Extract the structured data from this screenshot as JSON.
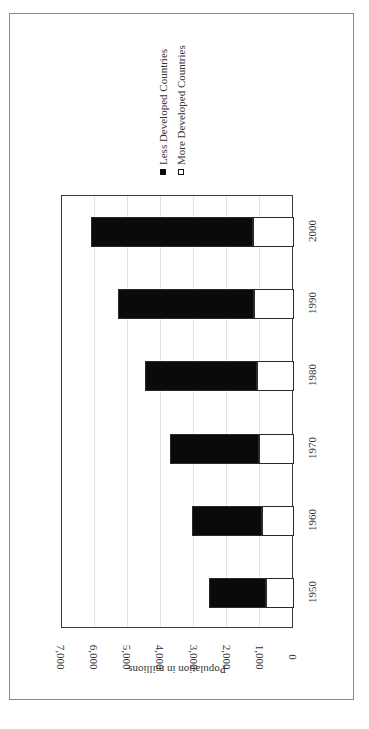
{
  "chart_data": {
    "type": "bar",
    "orientation": "stacked, image rotated 90° clockwise (bars extend upward in original orientation)",
    "title": "",
    "xlabel": "",
    "ylabel": "Population in millions",
    "ylim": [
      0,
      7000
    ],
    "yticks": [
      "0",
      "1,000",
      "2,000",
      "3,000",
      "4,000",
      "5,000",
      "6,000",
      "7,000"
    ],
    "categories": [
      "1950",
      "1960",
      "1970",
      "1980",
      "1990",
      "2000"
    ],
    "stacked": true,
    "grid": true,
    "legend_position": "right (top of rotated image)",
    "series": [
      {
        "name": "More Developed Countries",
        "color": "#ffffff",
        "values": [
          810,
          915,
          1000,
          1080,
          1150,
          1190
        ]
      },
      {
        "name": "Less Developed Countries",
        "color": "#0a0a0a",
        "values": [
          1710,
          2105,
          2700,
          3370,
          4120,
          4900
        ]
      }
    ],
    "totals": [
      2520,
      3020,
      3700,
      4450,
      5270,
      6090
    ]
  },
  "legend": {
    "items": [
      {
        "label": "Less Developed Countries",
        "swatch": "#0a0a0a"
      },
      {
        "label": "More Developed Countries",
        "swatch": "#ffffff"
      }
    ]
  },
  "axis": {
    "value_title": "Population in millions",
    "value_ticks": [
      "0",
      "1,000",
      "2,000",
      "3,000",
      "4,000",
      "5,000",
      "6,000",
      "7,000"
    ],
    "category_ticks": [
      "1950",
      "1960",
      "1970",
      "1980",
      "1990",
      "2000"
    ]
  }
}
